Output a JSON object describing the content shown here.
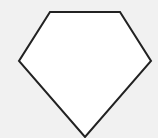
{
  "diagram": {
    "background_color": "#f1f1f1",
    "shape": {
      "type": "pentagon",
      "description": "gem/diamond-shaped pentagon",
      "fill": "#ffffff",
      "stroke": "#222222",
      "stroke_width": 2,
      "points": [
        [
          50,
          12
        ],
        [
          120,
          12
        ],
        [
          151,
          61
        ],
        [
          85,
          137
        ],
        [
          19,
          61
        ]
      ]
    }
  }
}
